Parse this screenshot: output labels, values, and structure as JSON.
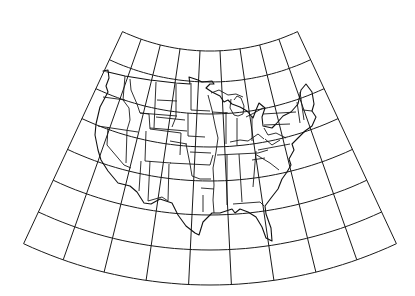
{
  "map": {
    "title": "",
    "projection": "conic",
    "region": "Contiguous United States",
    "colors": {
      "background": "#ffffff",
      "lines": "#1a1a1a"
    },
    "graticule": {
      "apex": [
        210,
        -156
      ],
      "radii": [
        207,
        238,
        270,
        303,
        337,
        371,
        406,
        441
      ],
      "angle_start_deg": -25.0,
      "angle_end_deg": 25.0,
      "meridian_count": 10
    },
    "features": [
      "state-boundaries",
      "coastline",
      "graticule"
    ]
  }
}
